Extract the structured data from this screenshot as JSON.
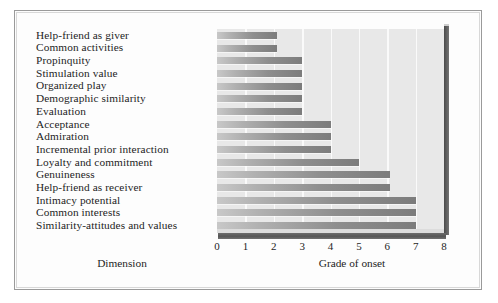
{
  "chart_data": {
    "type": "bar",
    "orientation": "horizontal",
    "title": "",
    "xlabel": "Grade of onset",
    "ylabel": "Dimension",
    "xlim": [
      0,
      8
    ],
    "xticks": [
      0,
      1,
      2,
      3,
      4,
      5,
      6,
      7,
      8
    ],
    "xtick_labels": [
      "0",
      "1",
      "2",
      "3",
      "4",
      "5",
      "6",
      "7",
      "8"
    ],
    "grid": "vertical-white-gridlines",
    "legend": "none",
    "categories": [
      "Help-friend as giver",
      "Common activities",
      "Propinquity",
      "Stimulation value",
      "Organized play",
      "Demographic similarity",
      "Evaluation",
      "Acceptance",
      "Admiration",
      "Incremental prior interaction",
      "Loyalty and commitment",
      "Genuineness",
      "Help-friend as receiver",
      "Intimacy potential",
      "Common interests",
      "Similarity-attitudes and values"
    ],
    "values": [
      2.1,
      2.1,
      3.0,
      3.0,
      3.0,
      3.0,
      3.0,
      4.0,
      4.0,
      4.0,
      5.0,
      6.1,
      6.1,
      7.0,
      7.0,
      7.0
    ],
    "colors": {
      "plot_background": "#e8e8e8",
      "gridline": "#fafafa",
      "bar_light": "#c8c8c8",
      "bar_dark": "#7c7c7c",
      "wall_shadow": "#565656",
      "frame_border": "#9a9a9a",
      "text": "#1d1d1d"
    }
  }
}
